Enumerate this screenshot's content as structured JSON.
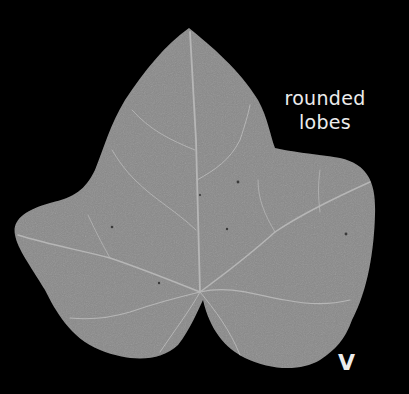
{
  "image": {
    "subject": "leaf",
    "background_color": "#000000",
    "leaf_color": "#8a8a8a",
    "vein_color": "#b8b8b8"
  },
  "annotations": {
    "lobes_label_line1": "rounded",
    "lobes_label_line2": "lobes",
    "panel_letter": "V"
  }
}
